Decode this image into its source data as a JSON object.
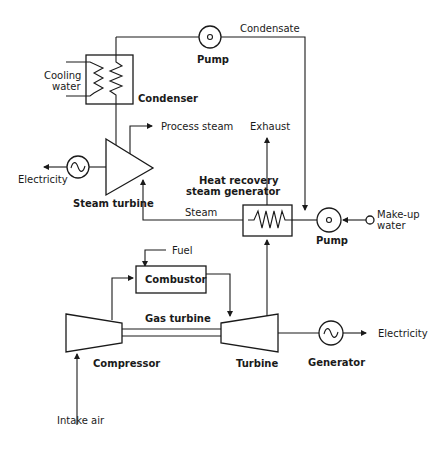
{
  "diagram": {
    "components": {
      "condenser": "Condenser",
      "cooling_water_1": "Cooling",
      "cooling_water_2": "water",
      "top_pump": "Pump",
      "condensate": "Condensate",
      "steam_turbine": "Steam turbine",
      "process_steam": "Process steam",
      "electricity_left": "Electricity",
      "exhaust": "Exhaust",
      "hrsg_1": "Heat recovery",
      "hrsg_2": "steam generator",
      "steam": "Steam",
      "bottom_pump": "Pump",
      "makeup_1": "Make-up",
      "makeup_2": "water",
      "fuel": "Fuel",
      "combustor": "Combustor",
      "gas_turbine": "Gas turbine",
      "compressor": "Compressor",
      "turbine": "Turbine",
      "generator": "Generator",
      "electricity_right": "Electricity",
      "intake_air": "Intake air"
    },
    "colors": {
      "line": "#1a1a1a",
      "background": "#ffffff"
    }
  }
}
